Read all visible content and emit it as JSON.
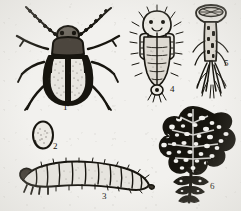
{
  "plate": {
    "title": "Insect life-cycle illustration plate",
    "description": "Black and white engraved scientific illustration of a leaf beetle (flea beetle) life stages and plant damage",
    "background_color": "#f2f1ee",
    "ink_color": "#17150f",
    "style": "stippled line engraving"
  },
  "figures": [
    {
      "number": "1",
      "name": "adult-beetle",
      "caption": "1",
      "subject": "Adult beetle, dorsal view with antennae, legs and striped elytra"
    },
    {
      "number": "2",
      "name": "egg",
      "caption": "2",
      "subject": "Egg, oval, stippled"
    },
    {
      "number": "3",
      "name": "larva",
      "caption": "3",
      "subject": "Larva, curved and segmented with bristles"
    },
    {
      "number": "4",
      "name": "pupa",
      "caption": "4",
      "subject": "Pupa, ventral view with setae"
    },
    {
      "number": "5",
      "name": "damaged-stem",
      "caption": "5",
      "subject": "Damaged plant stem and roots"
    },
    {
      "number": "6",
      "name": "damaged-leaf",
      "caption": "6",
      "subject": "Leaf skeletonized by feeding damage"
    }
  ]
}
